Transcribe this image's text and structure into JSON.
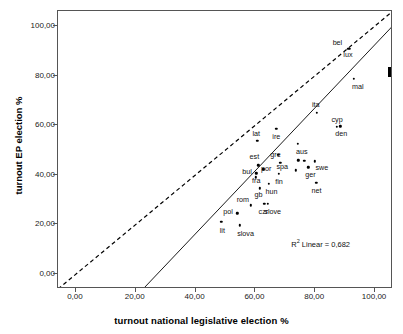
{
  "chart_data": {
    "type": "scatter",
    "title": "",
    "xlabel": "turnout national legislative election %",
    "ylabel": "turnout EP election %",
    "xlim": [
      -6,
      106
    ],
    "ylim": [
      -6,
      106
    ],
    "grid": false,
    "legend": null,
    "x_ticks": [
      "0,00",
      "20,00",
      "40,00",
      "60,00",
      "80,00",
      "100,00"
    ],
    "x_tick_values": [
      0,
      20,
      40,
      60,
      80,
      100
    ],
    "y_ticks": [
      "0,00",
      "20,00",
      "40,00",
      "60,00",
      "80,00",
      "100,00"
    ],
    "y_tick_values": [
      0,
      20,
      40,
      60,
      80,
      100
    ],
    "annotations": [
      {
        "name": "r2-linear",
        "text": "R² Linear = 0,682",
        "value": "0,682"
      },
      {
        "name": "arrow-pointer",
        "text": "",
        "value": "black right-pointing arrow highlighting bel/lux region"
      }
    ],
    "reference_line": {
      "name": "identity-line",
      "style": "dashed",
      "description": "y = x diagonal reference line",
      "slope": 1,
      "intercept": 0
    },
    "fit_line": {
      "name": "linear-regression-line",
      "style": "solid",
      "description": "linear fit of EP turnout on national turnout",
      "slope": 1.27,
      "intercept": -34.5
    },
    "points": [
      {
        "label": "bel",
        "x": 91.1,
        "y": 90.8,
        "label_dx": -11,
        "label_dy": -6
      },
      {
        "label": "lux",
        "x": 91.6,
        "y": 90.8,
        "label_dx": -2,
        "label_dy": 6
      },
      {
        "label": "mal",
        "x": 92.9,
        "y": 78.8,
        "label_dx": 4,
        "label_dy": 8
      },
      {
        "label": "ita",
        "x": 80.5,
        "y": 65.1,
        "label_dx": -1,
        "label_dy": -8
      },
      {
        "label": "cyp",
        "x": 87.3,
        "y": 59.4,
        "label_dx": 0,
        "label_dy": -7
      },
      {
        "label": "den",
        "x": 88.4,
        "y": 59.5,
        "label_dx": 1,
        "label_dy": 8
      },
      {
        "label": "lat",
        "x": 60.6,
        "y": 53.7,
        "label_dx": -1,
        "label_dy": -7
      },
      {
        "label": "ire",
        "x": 67.0,
        "y": 58.6,
        "label_dx": 0,
        "label_dy": 8
      },
      {
        "label": "aus",
        "x": 74.2,
        "y": 52.4,
        "label_dx": 4,
        "label_dy": 8
      },
      {
        "label": "gre",
        "x": 67.7,
        "y": 48.0,
        "label_dx": -3,
        "label_dy": 0
      },
      {
        "label": "est",
        "x": 61.0,
        "y": 43.9,
        "label_dx": -4,
        "label_dy": -8
      },
      {
        "label": "swe",
        "x": 79.9,
        "y": 45.5,
        "label_dx": 7,
        "label_dy": 7
      },
      {
        "label": "spa",
        "x": 68.3,
        "y": 44.9,
        "label_dx": 2,
        "label_dy": 4
      },
      {
        "label": "por",
        "x": 62.6,
        "y": 42.3,
        "label_dx": 3,
        "label_dy": 0
      },
      {
        "label": "ger",
        "x": 77.7,
        "y": 43.0,
        "label_dx": 2,
        "label_dy": 8
      },
      {
        "label": "bul",
        "x": 60.2,
        "y": 39.0,
        "label_dx": -9,
        "label_dy": -5
      },
      {
        "label": "fin",
        "x": 67.9,
        "y": 40.3,
        "label_dx": 0,
        "label_dy": 8
      },
      {
        "label": "fra",
        "x": 60.3,
        "y": 40.6,
        "label_dx": 0,
        "label_dy": 8
      },
      {
        "label": "net",
        "x": 80.4,
        "y": 36.8,
        "label_dx": 0,
        "label_dy": 8
      },
      {
        "label": "hun",
        "x": 64.4,
        "y": 36.3,
        "label_dx": 3,
        "label_dy": 8
      },
      {
        "label": "gb",
        "x": 61.4,
        "y": 34.5,
        "label_dx": -1,
        "label_dy": 7
      },
      {
        "label": "czr",
        "x": 63.0,
        "y": 28.3,
        "label_dx": -1,
        "label_dy": 8
      },
      {
        "label": "slove",
        "x": 64.1,
        "y": 28.3,
        "label_dx": 5,
        "label_dy": 8
      },
      {
        "label": "rom",
        "x": 58.5,
        "y": 27.7,
        "label_dx": -8,
        "label_dy": -5
      },
      {
        "label": "pol",
        "x": 53.9,
        "y": 24.5,
        "label_dx": -9,
        "label_dy": -1
      },
      {
        "label": "lit",
        "x": 48.6,
        "y": 21.0,
        "label_dx": 1,
        "label_dy": 9
      },
      {
        "label": "slova",
        "x": 54.7,
        "y": 19.6,
        "label_dx": 6,
        "label_dy": 9
      },
      {
        "label": "",
        "x": 74.4,
        "y": 45.9,
        "label_dx": 0,
        "label_dy": 0
      },
      {
        "label": "",
        "x": 76.3,
        "y": 45.6,
        "label_dx": 0,
        "label_dy": 0
      },
      {
        "label": "",
        "x": 73.6,
        "y": 41.8,
        "label_dx": 0,
        "label_dy": 0
      }
    ]
  },
  "axes": {
    "x_title": "turnout national legislative election %",
    "y_title": "turnout EP election %"
  },
  "notes": {
    "r2_label": "R² Linear = 0,682",
    "r2_prefix": "R",
    "r2_sup": "2",
    "r2_suffix": " Linear = 0,682"
  }
}
